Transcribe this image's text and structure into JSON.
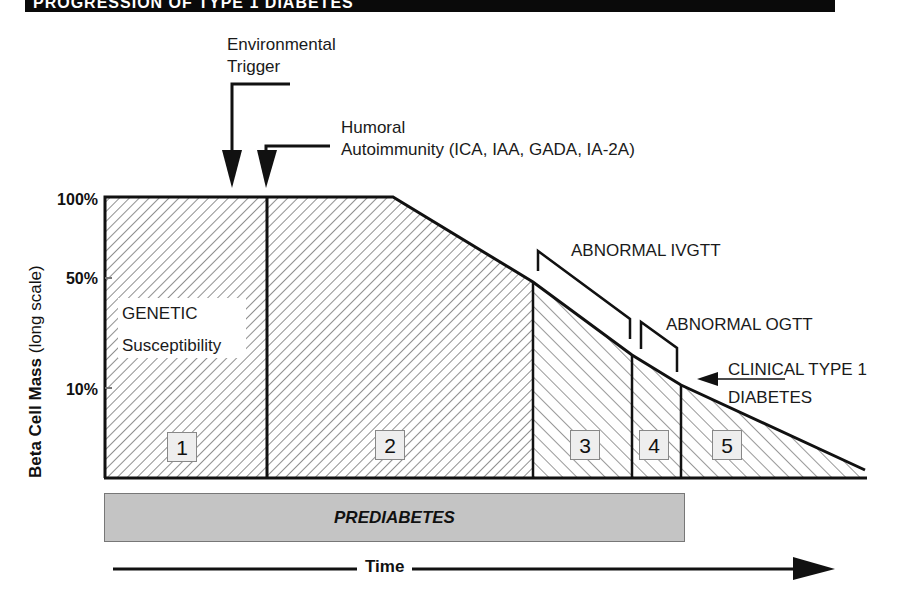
{
  "header": {
    "banner_text": "PROGRESSION OF TYPE 1 DIABETES"
  },
  "annotations": {
    "environmental_trigger": [
      "Environmental",
      "Trigger"
    ],
    "humoral_autoimmunity": [
      "Humoral",
      "Autoimmunity (ICA, IAA, GADA, IA-2A)"
    ],
    "abnormal_ivgtt": "ABNORMAL IVGTT",
    "abnormal_ogtt": "ABNORMAL OGTT",
    "clinical_diabetes": [
      "CLINICAL TYPE 1",
      "DIABETES"
    ],
    "genetic": [
      "GENETIC",
      "Susceptibility"
    ]
  },
  "y_axis": {
    "label_bold": "Beta Cell Mass",
    "label_rest": " (long scale)",
    "ticks": [
      "100%",
      "50%",
      "10%"
    ]
  },
  "stages": [
    "1",
    "2",
    "3",
    "4",
    "5"
  ],
  "prediabetes_label": "PREDIABETES",
  "x_axis": {
    "label": "Time"
  },
  "colors": {
    "hatch": "#333333",
    "prediabetes_fill": "#c4c4c4",
    "stage_box": "#eeeeee",
    "banner": "#0a0a0a"
  }
}
